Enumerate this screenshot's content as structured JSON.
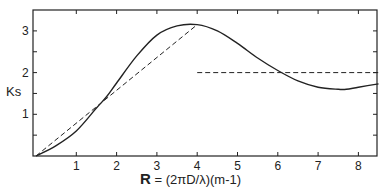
{
  "chart_data": {
    "type": "line",
    "title": "",
    "xlabel": "R = (2πD/λ)(m-1)",
    "xlabel_parts": {
      "bold": "R",
      "rest": " = (2πD/λ)(m-1)"
    },
    "ylabel": "Ks",
    "xlim": [
      0,
      8.5
    ],
    "ylim": [
      0,
      3.5
    ],
    "x_ticks": [
      1,
      2,
      3,
      4,
      5,
      6,
      7,
      8
    ],
    "x_tick_labels": [
      "1",
      "2",
      "3",
      "4",
      "5",
      "6",
      "7",
      "8"
    ],
    "y_ticks": [
      0.5,
      1,
      1.5,
      2,
      2.5,
      3
    ],
    "y_tick_labels": [
      "",
      "1",
      "",
      "2",
      "",
      "3"
    ],
    "grid": false,
    "legend": null,
    "series": [
      {
        "name": "Ks (extinction efficiency)",
        "style": "solid",
        "x": [
          0,
          0.5,
          1.0,
          1.5,
          1.75,
          2.0,
          2.5,
          3.0,
          3.5,
          4.0,
          4.5,
          5.0,
          5.5,
          6.0,
          6.5,
          7.0,
          7.5,
          7.7,
          8.0,
          8.5
        ],
        "y": [
          0,
          0.25,
          0.6,
          1.15,
          1.42,
          1.75,
          2.4,
          2.9,
          3.12,
          3.15,
          3.0,
          2.7,
          2.35,
          2.05,
          1.8,
          1.65,
          1.6,
          1.6,
          1.65,
          1.73
        ]
      },
      {
        "name": "linear approximation",
        "style": "dashed",
        "x": [
          0,
          4.0
        ],
        "y": [
          0,
          3.15
        ]
      },
      {
        "name": "asymptote Ks=2",
        "style": "dashed",
        "x": [
          4.0,
          8.5
        ],
        "y": [
          2,
          2
        ]
      }
    ]
  }
}
